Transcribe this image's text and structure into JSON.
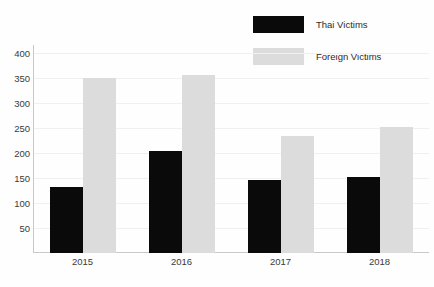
{
  "chart_data": {
    "type": "bar",
    "title": "",
    "xlabel": "",
    "ylabel": "",
    "categories": [
      "2015",
      "2016",
      "2017",
      "2018"
    ],
    "series": [
      {
        "name": "Thai Victims",
        "color": "#0a0a0a",
        "values": [
          132,
          204,
          145,
          152
        ]
      },
      {
        "name": "Foreign Victims",
        "color": "#dcdcdc",
        "values": [
          350,
          355,
          233,
          251
        ]
      }
    ],
    "ylim": [
      0,
      415
    ],
    "yticks": [
      50,
      100,
      150,
      200,
      250,
      300,
      350,
      400
    ],
    "ytick_labels": [
      "50",
      "100",
      "150",
      "200",
      "250",
      "300",
      "350",
      "400"
    ],
    "grid": true,
    "grid_axis": "y",
    "legend_position": "top-right"
  },
  "legend": {
    "items": [
      {
        "label": "Thai Victims",
        "swatch": "black-swatch-icon"
      },
      {
        "label": "Foreign Victims",
        "swatch": "gray-swatch-icon"
      }
    ]
  }
}
